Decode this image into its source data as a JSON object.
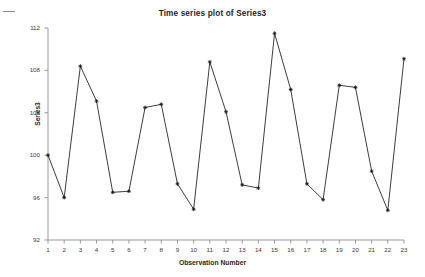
{
  "figure": {
    "corner_mark": "dash-mark"
  },
  "chart_data": {
    "type": "line",
    "title": "Time series plot of Series3",
    "xlabel": "Observation Number",
    "ylabel": "Series3",
    "x": [
      1,
      2,
      3,
      4,
      5,
      6,
      7,
      8,
      9,
      10,
      11,
      12,
      13,
      14,
      15,
      16,
      17,
      18,
      19,
      20,
      21,
      22,
      23
    ],
    "values": [
      100.0,
      96.0,
      108.4,
      105.1,
      96.5,
      96.6,
      104.5,
      104.8,
      97.3,
      94.9,
      108.8,
      104.1,
      97.2,
      96.9,
      111.5,
      106.2,
      97.3,
      95.8,
      106.6,
      106.4,
      98.5,
      94.8,
      109.1
    ],
    "categories": [
      "1",
      "2",
      "3",
      "4",
      "5",
      "6",
      "7",
      "8",
      "9",
      "10",
      "11",
      "12",
      "13",
      "14",
      "15",
      "16",
      "17",
      "18",
      "19",
      "20",
      "21",
      "22",
      "23"
    ],
    "xlim": [
      1,
      23
    ],
    "ylim": [
      92,
      112
    ],
    "yticks": [
      92,
      96,
      100,
      104,
      108,
      112
    ],
    "ytick_labels": [
      "92",
      "96",
      "100",
      "104",
      "108",
      "112"
    ],
    "xticks": [
      1,
      2,
      3,
      4,
      5,
      6,
      7,
      8,
      9,
      10,
      11,
      12,
      13,
      14,
      15,
      16,
      17,
      18,
      19,
      20,
      21,
      22,
      23
    ],
    "xtick_labels": [
      "1",
      "2",
      "3",
      "4",
      "5",
      "6",
      "7",
      "8",
      "9",
      "10",
      "11",
      "12",
      "13",
      "14",
      "15",
      "16",
      "17",
      "18",
      "19",
      "20",
      "21",
      "22",
      "23"
    ],
    "grid": false,
    "legend": null,
    "series_name": "Series3",
    "line_color": "#3d3d3d",
    "marker_color": "#1a1a1a",
    "marker": "star",
    "axis_color": "#8f8f8f"
  }
}
